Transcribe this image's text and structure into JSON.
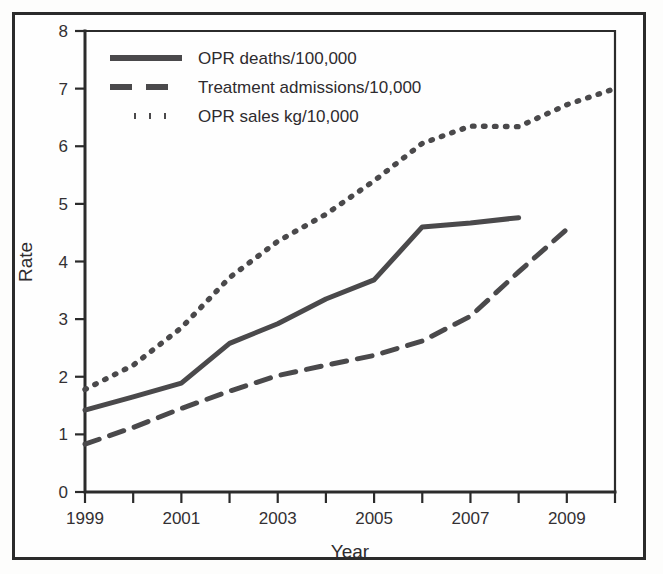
{
  "chart_data": {
    "type": "line",
    "title": "",
    "xlabel": "Year",
    "ylabel": "Rate",
    "xlim": [
      1999,
      2010
    ],
    "ylim": [
      0,
      8
    ],
    "grid": false,
    "legend_position": "top-left",
    "x_tick_labels": [
      "1999",
      "",
      "2001",
      "",
      "2003",
      "",
      "2005",
      "",
      "2007",
      "",
      "2009",
      ""
    ],
    "x_ticks_all": [
      1999,
      2000,
      2001,
      2002,
      2003,
      2004,
      2005,
      2006,
      2007,
      2008,
      2009,
      2010
    ],
    "y_tick_labels": [
      "0",
      "1",
      "2",
      "3",
      "4",
      "5",
      "6",
      "7",
      "8"
    ],
    "y_ticks": [
      0,
      1,
      2,
      3,
      4,
      5,
      6,
      7,
      8
    ],
    "series": [
      {
        "name": "OPR deaths/100,000",
        "style": "solid",
        "x": [
          1999,
          2000,
          2001,
          2002,
          2003,
          2004,
          2005,
          2006,
          2007,
          2008
        ],
        "values": [
          1.42,
          1.65,
          1.89,
          2.58,
          2.92,
          3.35,
          3.68,
          4.6,
          4.67,
          4.76
        ]
      },
      {
        "name": "Treatment admissions/10,000",
        "style": "dashed",
        "x": [
          1999,
          2000,
          2001,
          2002,
          2003,
          2004,
          2005,
          2006,
          2007,
          2008,
          2009
        ],
        "values": [
          0.83,
          1.12,
          1.45,
          1.75,
          2.02,
          2.2,
          2.37,
          2.62,
          3.05,
          3.82,
          4.56
        ]
      },
      {
        "name": "OPR sales kg/10,000",
        "style": "dotted",
        "x": [
          1999,
          2000,
          2001,
          2002,
          2003,
          2004,
          2005,
          2006,
          2007,
          2008,
          2009,
          2010
        ],
        "values": [
          1.78,
          2.2,
          2.85,
          3.72,
          4.35,
          4.82,
          5.4,
          6.05,
          6.35,
          6.34,
          6.72,
          7.0
        ]
      }
    ]
  },
  "axes": {
    "y_title": "Rate",
    "x_title": "Year"
  },
  "legend": {
    "entries": [
      {
        "label": "OPR deaths/100,000",
        "style": "solid"
      },
      {
        "label": "Treatment admissions/10,000",
        "style": "dashed"
      },
      {
        "label": "OPR sales kg/10,000",
        "style": "dotted"
      }
    ]
  }
}
